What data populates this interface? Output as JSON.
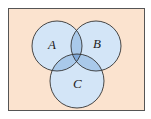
{
  "diagram": {
    "type": "venn",
    "sets": [
      {
        "label": "A",
        "cx": 57,
        "cy": 46,
        "r": 25
      },
      {
        "label": "B",
        "cx": 96,
        "cy": 46,
        "r": 25
      },
      {
        "label": "C",
        "cx": 77,
        "cy": 81,
        "r": 27
      }
    ],
    "colors": {
      "background": "#fbe3cf",
      "border": "#555555",
      "circle_fill": "#cfe3f7",
      "overlap_fill": "#8fb5e0",
      "circle_stroke": "#333333"
    }
  }
}
